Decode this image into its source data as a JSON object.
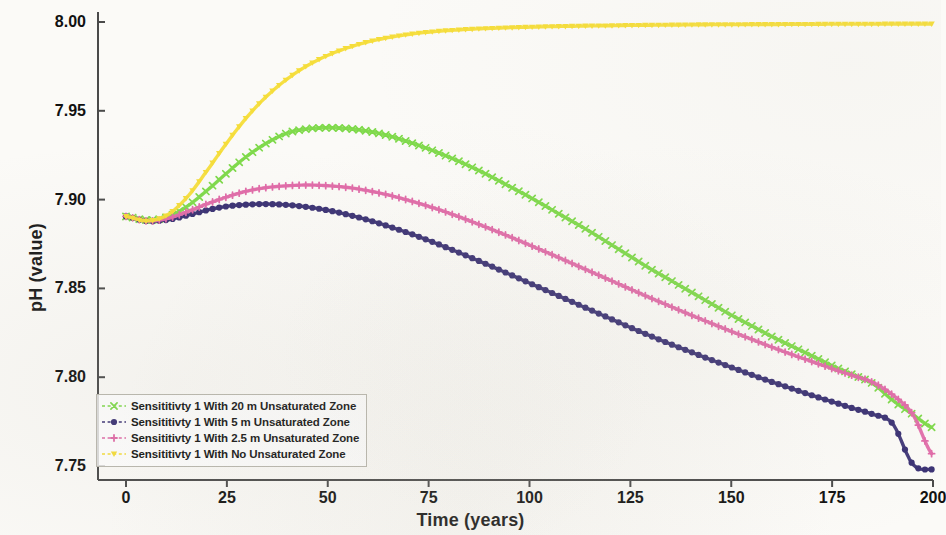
{
  "chart_data": {
    "type": "line",
    "title": "",
    "xlabel": "Time (years)",
    "ylabel": "pH (value)",
    "xlim": [
      0,
      200
    ],
    "ylim": [
      7.75,
      8.0
    ],
    "xticks": [
      "0",
      "25",
      "50",
      "75",
      "100",
      "125",
      "150",
      "175",
      "200"
    ],
    "yticks": [
      "7.75",
      "7.80",
      "7.85",
      "7.90",
      "7.95",
      "8.00"
    ],
    "grid": false,
    "legend_position": "lower left",
    "x": [
      0,
      5,
      10,
      15,
      20,
      25,
      30,
      35,
      40,
      45,
      50,
      55,
      60,
      65,
      70,
      75,
      80,
      85,
      90,
      95,
      100,
      105,
      110,
      115,
      120,
      125,
      130,
      135,
      140,
      145,
      150,
      155,
      160,
      165,
      170,
      175,
      180,
      185,
      190,
      195,
      200
    ],
    "series": [
      {
        "name": "Sensititivty 1 With 20 m Unsaturated Zone",
        "color": "#7ed94a",
        "marker": "x",
        "values": [
          7.8905,
          7.8885,
          7.89,
          7.896,
          7.905,
          7.915,
          7.9245,
          7.932,
          7.9375,
          7.9398,
          7.9405,
          7.94,
          7.9385,
          7.936,
          7.9325,
          7.9285,
          7.924,
          7.919,
          7.9135,
          7.9075,
          7.9015,
          7.895,
          7.8885,
          7.882,
          7.875,
          7.868,
          7.861,
          7.8545,
          7.848,
          7.8415,
          7.835,
          7.829,
          7.823,
          7.8175,
          7.812,
          7.8065,
          7.8015,
          7.7965,
          7.787,
          7.779,
          7.7715
        ]
      },
      {
        "name": "Sensititivty 1 With 5 m  Unsaturated Zone",
        "color": "#3b3274",
        "marker": "o",
        "values": [
          7.8905,
          7.888,
          7.8885,
          7.891,
          7.894,
          7.8962,
          7.8972,
          7.8975,
          7.897,
          7.8958,
          7.894,
          7.8915,
          7.8885,
          7.885,
          7.8812,
          7.877,
          7.8725,
          7.8678,
          7.863,
          7.858,
          7.853,
          7.848,
          7.843,
          7.838,
          7.833,
          7.828,
          7.8232,
          7.8186,
          7.8142,
          7.8098,
          7.8056,
          7.8014,
          7.7974,
          7.7936,
          7.7898,
          7.7862,
          7.7826,
          7.7792,
          7.7738,
          7.751,
          7.748
        ]
      },
      {
        "name": "Sensititivty 1 With 2.5 m  Unsaturated Zone",
        "color": "#e06ba8",
        "marker": "+",
        "values": [
          7.8905,
          7.888,
          7.8892,
          7.893,
          7.8975,
          7.9015,
          7.9048,
          7.9068,
          7.9078,
          7.9082,
          7.9078,
          7.9068,
          7.905,
          7.9026,
          7.8996,
          7.8962,
          7.8924,
          7.8882,
          7.8838,
          7.8792,
          7.8744,
          7.8696,
          7.8646,
          7.8596,
          7.8546,
          7.8496,
          7.8446,
          7.8398,
          7.835,
          7.8304,
          7.8258,
          7.8214,
          7.817,
          7.8128,
          7.8088,
          7.8048,
          7.801,
          7.7972,
          7.79,
          7.779,
          7.756
        ]
      },
      {
        "name": "Sensititivty 1 With No Unsaturated Zone",
        "color": "#f5dd3a",
        "marker": "v",
        "values": [
          7.8905,
          7.888,
          7.891,
          7.901,
          7.916,
          7.932,
          7.9465,
          7.9585,
          7.968,
          7.9755,
          7.9812,
          7.9855,
          7.9888,
          7.9912,
          7.993,
          7.9943,
          7.9952,
          7.9959,
          7.9964,
          7.9968,
          7.9971,
          7.9974,
          7.9976,
          7.9978,
          7.9979,
          7.9981,
          7.9982,
          7.9983,
          7.9984,
          7.9985,
          7.9985,
          7.9986,
          7.9986,
          7.9987,
          7.9987,
          7.9988,
          7.9988,
          7.9988,
          7.9989,
          7.9989,
          7.9989
        ]
      }
    ]
  },
  "legend": {
    "items": [
      {
        "label": "Sensititivty 1 With 20 m Unsaturated Zone",
        "color": "#7ed94a",
        "marker": "x"
      },
      {
        "label": "Sensititivty 1 With 5 m  Unsaturated Zone",
        "color": "#3b3274",
        "marker": "o"
      },
      {
        "label": "Sensititivty 1 With 2.5 m  Unsaturated Zone",
        "color": "#e06ba8",
        "marker": "+"
      },
      {
        "label": "Sensititivty 1 With No Unsaturated Zone",
        "color": "#f5dd3a",
        "marker": "v"
      }
    ]
  },
  "axes": {
    "x_title": "Time (years)",
    "y_title": "pH (value)"
  }
}
